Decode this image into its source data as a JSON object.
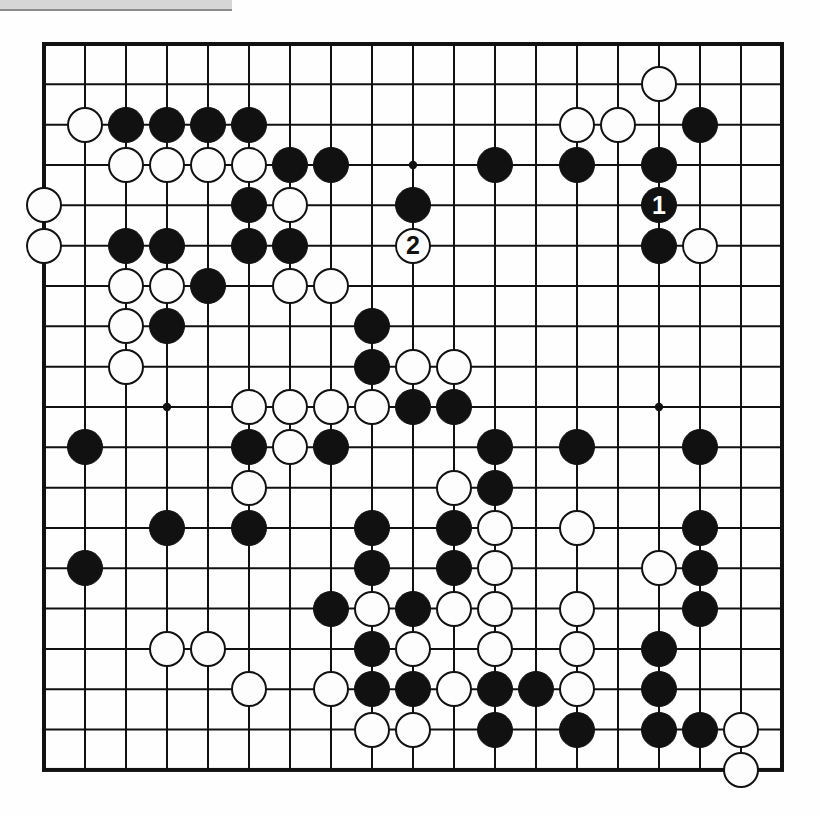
{
  "diagram": {
    "type": "go-board-diagram",
    "board_size": 19,
    "title": "",
    "colors": {
      "line": "#111111",
      "black_stone": "#111111",
      "white_stone": "#fdfdfd",
      "white_stone_outline": "#111111",
      "background": "#ffffff"
    },
    "geometry": {
      "origin_x": 44,
      "origin_y": 44,
      "step_x": 41.0,
      "step_y": 40.33,
      "stone_diameter": 36,
      "border_width": 4,
      "line_width": 2
    },
    "star_points": [
      {
        "col": 4,
        "row": 4
      },
      {
        "col": 10,
        "row": 4
      },
      {
        "col": 16,
        "row": 4
      },
      {
        "col": 4,
        "row": 10
      },
      {
        "col": 10,
        "row": 10
      },
      {
        "col": 16,
        "row": 10
      },
      {
        "col": 4,
        "row": 16
      },
      {
        "col": 10,
        "row": 16
      },
      {
        "col": 16,
        "row": 16
      }
    ],
    "move_markers": [
      {
        "label": "1",
        "col": 16,
        "row": 5,
        "color": "black"
      },
      {
        "label": "2",
        "col": 10,
        "row": 6,
        "color": "white"
      }
    ],
    "stones": [
      {
        "col": 2,
        "row": 3,
        "color": "white"
      },
      {
        "col": 3,
        "row": 3,
        "color": "black"
      },
      {
        "col": 4,
        "row": 3,
        "color": "black"
      },
      {
        "col": 5,
        "row": 3,
        "color": "black"
      },
      {
        "col": 6,
        "row": 3,
        "color": "black"
      },
      {
        "col": 14,
        "row": 3,
        "color": "white"
      },
      {
        "col": 15,
        "row": 3,
        "color": "white"
      },
      {
        "col": 17,
        "row": 3,
        "color": "black"
      },
      {
        "col": 16,
        "row": 2,
        "color": "white"
      },
      {
        "col": 3,
        "row": 4,
        "color": "white"
      },
      {
        "col": 4,
        "row": 4,
        "color": "white"
      },
      {
        "col": 5,
        "row": 4,
        "color": "white"
      },
      {
        "col": 6,
        "row": 4,
        "color": "white"
      },
      {
        "col": 7,
        "row": 4,
        "color": "black"
      },
      {
        "col": 8,
        "row": 4,
        "color": "black"
      },
      {
        "col": 12,
        "row": 4,
        "color": "black"
      },
      {
        "col": 14,
        "row": 4,
        "color": "black"
      },
      {
        "col": 16,
        "row": 4,
        "color": "black"
      },
      {
        "col": 1,
        "row": 5,
        "color": "white"
      },
      {
        "col": 6,
        "row": 5,
        "color": "black"
      },
      {
        "col": 7,
        "row": 5,
        "color": "white"
      },
      {
        "col": 10,
        "row": 5,
        "color": "black"
      },
      {
        "col": 1,
        "row": 6,
        "color": "white"
      },
      {
        "col": 3,
        "row": 6,
        "color": "black"
      },
      {
        "col": 4,
        "row": 6,
        "color": "black"
      },
      {
        "col": 6,
        "row": 6,
        "color": "black"
      },
      {
        "col": 7,
        "row": 6,
        "color": "black"
      },
      {
        "col": 16,
        "row": 6,
        "color": "black"
      },
      {
        "col": 17,
        "row": 6,
        "color": "white"
      },
      {
        "col": 3,
        "row": 7,
        "color": "white"
      },
      {
        "col": 4,
        "row": 7,
        "color": "white"
      },
      {
        "col": 5,
        "row": 7,
        "color": "black"
      },
      {
        "col": 7,
        "row": 7,
        "color": "white"
      },
      {
        "col": 8,
        "row": 7,
        "color": "white"
      },
      {
        "col": 3,
        "row": 8,
        "color": "white"
      },
      {
        "col": 4,
        "row": 8,
        "color": "black"
      },
      {
        "col": 9,
        "row": 8,
        "color": "black"
      },
      {
        "col": 3,
        "row": 9,
        "color": "white"
      },
      {
        "col": 9,
        "row": 9,
        "color": "black"
      },
      {
        "col": 10,
        "row": 9,
        "color": "white"
      },
      {
        "col": 11,
        "row": 9,
        "color": "white"
      },
      {
        "col": 6,
        "row": 10,
        "color": "white"
      },
      {
        "col": 7,
        "row": 10,
        "color": "white"
      },
      {
        "col": 8,
        "row": 10,
        "color": "white"
      },
      {
        "col": 9,
        "row": 10,
        "color": "white"
      },
      {
        "col": 10,
        "row": 10,
        "color": "black"
      },
      {
        "col": 11,
        "row": 10,
        "color": "black"
      },
      {
        "col": 2,
        "row": 11,
        "color": "black"
      },
      {
        "col": 6,
        "row": 11,
        "color": "black"
      },
      {
        "col": 7,
        "row": 11,
        "color": "white"
      },
      {
        "col": 8,
        "row": 11,
        "color": "black"
      },
      {
        "col": 12,
        "row": 11,
        "color": "black"
      },
      {
        "col": 14,
        "row": 11,
        "color": "black"
      },
      {
        "col": 17,
        "row": 11,
        "color": "black"
      },
      {
        "col": 6,
        "row": 12,
        "color": "white"
      },
      {
        "col": 11,
        "row": 12,
        "color": "white"
      },
      {
        "col": 12,
        "row": 12,
        "color": "black"
      },
      {
        "col": 4,
        "row": 13,
        "color": "black"
      },
      {
        "col": 6,
        "row": 13,
        "color": "black"
      },
      {
        "col": 9,
        "row": 13,
        "color": "black"
      },
      {
        "col": 11,
        "row": 13,
        "color": "black"
      },
      {
        "col": 12,
        "row": 13,
        "color": "white"
      },
      {
        "col": 14,
        "row": 13,
        "color": "white"
      },
      {
        "col": 17,
        "row": 13,
        "color": "black"
      },
      {
        "col": 2,
        "row": 14,
        "color": "black"
      },
      {
        "col": 9,
        "row": 14,
        "color": "black"
      },
      {
        "col": 11,
        "row": 14,
        "color": "black"
      },
      {
        "col": 12,
        "row": 14,
        "color": "white"
      },
      {
        "col": 16,
        "row": 14,
        "color": "white"
      },
      {
        "col": 17,
        "row": 14,
        "color": "black"
      },
      {
        "col": 8,
        "row": 15,
        "color": "black"
      },
      {
        "col": 9,
        "row": 15,
        "color": "white"
      },
      {
        "col": 10,
        "row": 15,
        "color": "black"
      },
      {
        "col": 11,
        "row": 15,
        "color": "white"
      },
      {
        "col": 12,
        "row": 15,
        "color": "white"
      },
      {
        "col": 14,
        "row": 15,
        "color": "white"
      },
      {
        "col": 17,
        "row": 15,
        "color": "black"
      },
      {
        "col": 4,
        "row": 16,
        "color": "white"
      },
      {
        "col": 5,
        "row": 16,
        "color": "white"
      },
      {
        "col": 9,
        "row": 16,
        "color": "black"
      },
      {
        "col": 10,
        "row": 16,
        "color": "white"
      },
      {
        "col": 12,
        "row": 16,
        "color": "white"
      },
      {
        "col": 14,
        "row": 16,
        "color": "white"
      },
      {
        "col": 16,
        "row": 16,
        "color": "black"
      },
      {
        "col": 6,
        "row": 17,
        "color": "white"
      },
      {
        "col": 8,
        "row": 17,
        "color": "white"
      },
      {
        "col": 9,
        "row": 17,
        "color": "black"
      },
      {
        "col": 10,
        "row": 17,
        "color": "black"
      },
      {
        "col": 11,
        "row": 17,
        "color": "white"
      },
      {
        "col": 12,
        "row": 17,
        "color": "black"
      },
      {
        "col": 13,
        "row": 17,
        "color": "black"
      },
      {
        "col": 14,
        "row": 17,
        "color": "white"
      },
      {
        "col": 16,
        "row": 17,
        "color": "black"
      },
      {
        "col": 9,
        "row": 18,
        "color": "white"
      },
      {
        "col": 10,
        "row": 18,
        "color": "white"
      },
      {
        "col": 12,
        "row": 18,
        "color": "black"
      },
      {
        "col": 14,
        "row": 18,
        "color": "black"
      },
      {
        "col": 16,
        "row": 18,
        "color": "black"
      },
      {
        "col": 17,
        "row": 18,
        "color": "black"
      },
      {
        "col": 18,
        "row": 18,
        "color": "white"
      },
      {
        "col": 18,
        "row": 19,
        "color": "white"
      }
    ]
  }
}
